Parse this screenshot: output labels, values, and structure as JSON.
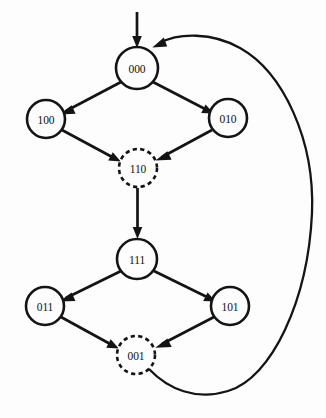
{
  "diagram": {
    "colors": {
      "background": "#fdfdfd",
      "stroke": "#141414",
      "node_fill": "#fdfdfd",
      "label": "#101010"
    },
    "nodes": [
      {
        "id": "n000",
        "label": "000",
        "x": 137,
        "y": 68,
        "r": 21,
        "style": "solid"
      },
      {
        "id": "n100",
        "label": "100",
        "x": 46,
        "y": 119,
        "r": 19,
        "style": "solid"
      },
      {
        "id": "n010",
        "label": "010",
        "x": 228,
        "y": 118,
        "r": 19,
        "style": "solid"
      },
      {
        "id": "n110",
        "label": "110",
        "x": 138,
        "y": 168,
        "r": 19,
        "style": "dashed"
      },
      {
        "id": "n111",
        "label": "111",
        "x": 137,
        "y": 259,
        "r": 20,
        "style": "solid"
      },
      {
        "id": "n011",
        "label": "011",
        "x": 45,
        "y": 306,
        "r": 19,
        "style": "solid"
      },
      {
        "id": "n101",
        "label": "101",
        "x": 230,
        "y": 306,
        "r": 19,
        "style": "solid"
      },
      {
        "id": "n001",
        "label": "001",
        "x": 136,
        "y": 355,
        "r": 19,
        "style": "dashed"
      }
    ],
    "edges": [
      {
        "from": "start",
        "to": "n000",
        "kind": "entry",
        "arrow": true
      },
      {
        "from": "n000",
        "to": "n100",
        "kind": "straight",
        "arrow": true
      },
      {
        "from": "n000",
        "to": "n010",
        "kind": "straight",
        "arrow": true
      },
      {
        "from": "n100",
        "to": "n110",
        "kind": "straight",
        "arrow": true
      },
      {
        "from": "n010",
        "to": "n110",
        "kind": "straight",
        "arrow": true
      },
      {
        "from": "n110",
        "to": "n111",
        "kind": "straight",
        "arrow": true
      },
      {
        "from": "n111",
        "to": "n011",
        "kind": "straight",
        "arrow": true
      },
      {
        "from": "n111",
        "to": "n101",
        "kind": "straight",
        "arrow": true
      },
      {
        "from": "n011",
        "to": "n001",
        "kind": "straight",
        "arrow": true
      },
      {
        "from": "n101",
        "to": "n001",
        "kind": "straight",
        "arrow": true
      },
      {
        "from": "n001",
        "to": "n000",
        "kind": "feedback-arc",
        "arrow": true
      }
    ]
  }
}
